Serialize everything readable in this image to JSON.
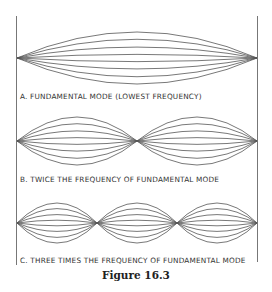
{
  "figure": {
    "caption": "Figure 16.3",
    "panels": [
      {
        "id": "A",
        "label": "A. FUNDAMENTAL MODE (LOWEST FREQUENCY)",
        "segments": 1
      },
      {
        "id": "B",
        "label": "B. TWICE THE FREQUENCY OF FUNDAMENTAL MODE",
        "segments": 2
      },
      {
        "id": "C",
        "label": "C. THREE TIMES THE FREQUENCY OF FUNDAMENTAL MODE",
        "segments": 3
      }
    ],
    "colors": {
      "line": "#555555",
      "wall": "#777777",
      "text": "#333333"
    }
  }
}
